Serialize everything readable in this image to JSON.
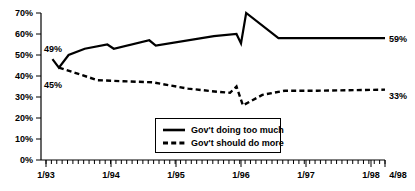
{
  "chart_data": {
    "type": "line",
    "title": "",
    "xlabel": "",
    "ylabel": "",
    "ylim": [
      0,
      70
    ],
    "ytick_labels": [
      "0%",
      "10%",
      "20%",
      "30%",
      "40%",
      "50%",
      "60%",
      "70%"
    ],
    "ytick_values": [
      0,
      10,
      20,
      30,
      40,
      50,
      60,
      70
    ],
    "xtick_labels": [
      "1/93",
      "1/94",
      "1/95",
      "1/96",
      "1/97",
      "1/98",
      "4/98"
    ],
    "xtick_values": [
      1993.0,
      1994.0,
      1995.0,
      1996.0,
      1997.0,
      1998.0,
      1998.25
    ],
    "xlim": [
      1993.0,
      1998.25
    ],
    "grid": false,
    "minor_ticks": "monthly",
    "legend_position": "bottom-center",
    "series": [
      {
        "name": "Gov't doing too much",
        "style": "solid",
        "end_label": "59%",
        "start_label": "49%",
        "x": [
          1993.1,
          1993.2,
          1993.35,
          1993.6,
          1993.95,
          1994.05,
          1994.6,
          1994.7,
          1995.6,
          1995.95,
          1996.02,
          1996.1,
          1996.6,
          1998.25
        ],
        "values": [
          48,
          44,
          50,
          53,
          55,
          53,
          57,
          54.5,
          59,
          60,
          55.5,
          70,
          58,
          58
        ]
      },
      {
        "name": "Gov't should do more",
        "style": "dashed",
        "end_label": "33%",
        "start_label": "45%",
        "x": [
          1993.2,
          1993.45,
          1993.8,
          1994.2,
          1994.65,
          1995.2,
          1995.65,
          1995.85,
          1995.95,
          1996.05,
          1996.35,
          1996.7,
          1997.2,
          1998.25
        ],
        "values": [
          44,
          41.5,
          38,
          37.5,
          37,
          34,
          32.5,
          32,
          35,
          26,
          31,
          33,
          33,
          33.5
        ]
      }
    ],
    "annotations": [
      {
        "name": "solid-start-value",
        "text": "49%",
        "series": "Gov't doing too much"
      },
      {
        "name": "dashed-start-value",
        "text": "45%",
        "series": "Gov't should do more"
      },
      {
        "name": "solid-end-value",
        "text": "59%",
        "series": "Gov't doing too much"
      },
      {
        "name": "dashed-end-value",
        "text": "33%",
        "series": "Gov't should do more"
      }
    ]
  },
  "legend": {
    "entries": [
      {
        "label": "Gov't doing too much",
        "style": "solid"
      },
      {
        "label": "Gov't should do more",
        "style": "dashed"
      }
    ]
  }
}
